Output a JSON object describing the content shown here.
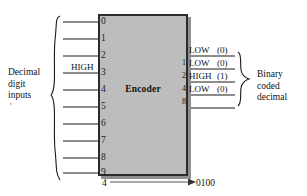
{
  "diagram": {
    "chip": {
      "label": "Encoder"
    },
    "inputs": {
      "caption": [
        "Decimal",
        "digit",
        "inputs"
      ],
      "digits": [
        "0",
        "1",
        "2",
        "3",
        "4",
        "5",
        "6",
        "7",
        "8",
        "9"
      ],
      "active_label": "HIGH",
      "active_digit": "4"
    },
    "outputs": {
      "caption": [
        "Binary",
        "coded",
        "decimal"
      ],
      "pins": [
        {
          "pin": "1",
          "state": "LOW",
          "bit": "(0)"
        },
        {
          "pin": "2",
          "state": "LOW",
          "bit": "(0)"
        },
        {
          "pin": "4",
          "state": "HIGH",
          "bit": "(1)"
        },
        {
          "pin": "8",
          "state": "LOW",
          "bit": "(0)"
        }
      ]
    },
    "equation": {
      "input": "4",
      "output": "0100"
    },
    "colors": {
      "chip_fill": "#bdbdbd",
      "chip_border": "#2b2b2b",
      "line": "#1a1a1a",
      "background": "#ffffff"
    },
    "stray_mark": "'"
  }
}
